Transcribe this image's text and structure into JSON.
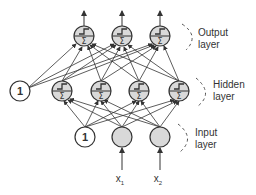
{
  "diagram": {
    "type": "neural-network",
    "layers": [
      {
        "name": "Output layer",
        "line1": "Output",
        "line2": "layer",
        "nodes": 3
      },
      {
        "name": "Hidden layer",
        "line1": "Hidden",
        "line2": "layer",
        "nodes": 4,
        "bias_label": "1"
      },
      {
        "name": "Input layer",
        "line1": "Input",
        "line2": "layer",
        "nodes": 2,
        "bias_label": "1"
      }
    ],
    "inputs": [
      {
        "base": "x",
        "sub": "1"
      },
      {
        "base": "x",
        "sub": "2"
      }
    ],
    "node_icon": "step-sum-icon",
    "colors": {
      "node_fill": "#d9d9d9",
      "stroke": "#333333",
      "bias_fill": "#ffffff"
    }
  }
}
